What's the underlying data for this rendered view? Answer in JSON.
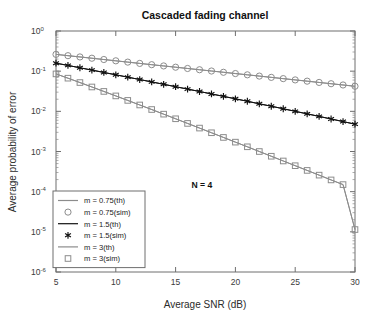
{
  "chart_data": {
    "type": "line",
    "title": "Cascaded fading channel",
    "xlabel": "Average SNR (dB)",
    "ylabel": "Average probability of error",
    "xlim": [
      5,
      30
    ],
    "ylim": [
      1e-06,
      1
    ],
    "yscale": "log",
    "grid": false,
    "legend_position": "lower-left",
    "xticks": [
      5,
      10,
      15,
      20,
      25,
      30
    ],
    "xtick_labels": [
      "5",
      "10",
      "15",
      "20",
      "25",
      "30"
    ],
    "yticks": [
      1,
      0.1,
      0.01,
      0.001,
      0.0001,
      1e-05,
      1e-06
    ],
    "ytick_labels": [
      "10^0",
      "10^-1",
      "10^-2",
      "10^-3",
      "10^-4",
      "10^-5",
      "10^-6"
    ],
    "ytick_mantissa": [
      "10",
      "10",
      "10",
      "10",
      "10",
      "10",
      "10"
    ],
    "ytick_exponent": [
      "0",
      "-1",
      "-2",
      "-3",
      "-4",
      "-5",
      "-6"
    ],
    "annotations": [
      {
        "text": "N = 4",
        "x": 17.2,
        "y": 0.00012
      }
    ],
    "x": [
      5,
      6,
      7,
      8,
      9,
      10,
      11,
      12,
      13,
      14,
      15,
      16,
      17,
      18,
      19,
      20,
      21,
      22,
      23,
      24,
      25,
      26,
      27,
      28,
      29,
      30
    ],
    "series": [
      {
        "name": "m = 0.75(th)",
        "label": "m = 0.75(th)",
        "marker": "none",
        "line": "solid",
        "color": "#8c8c8c",
        "values": [
          0.262,
          0.243,
          0.226,
          0.21,
          0.195,
          0.181,
          0.168,
          0.156,
          0.145,
          0.135,
          0.1255,
          0.1167,
          0.1085,
          0.1009,
          0.0938,
          0.0872,
          0.0811,
          0.0754,
          0.0701,
          0.0652,
          0.0606,
          0.0564,
          0.0524,
          0.0487,
          0.0453,
          0.0421
        ]
      },
      {
        "name": "m = 0.75(sim)",
        "label": "m = 0.75(sim)",
        "marker": "circle",
        "line": "solid",
        "color": "#8c8c8c",
        "values": [
          0.262,
          0.243,
          0.226,
          0.21,
          0.195,
          0.181,
          0.168,
          0.156,
          0.145,
          0.135,
          0.1255,
          0.1167,
          0.1085,
          0.1009,
          0.0938,
          0.0872,
          0.0811,
          0.0754,
          0.0701,
          0.0652,
          0.0606,
          0.0564,
          0.0524,
          0.0487,
          0.0453,
          0.0421
        ]
      },
      {
        "name": "m = 1.5(th)",
        "label": "m = 1.5(th)",
        "marker": "none",
        "line": "solid",
        "color": "#111111",
        "values": [
          0.158,
          0.139,
          0.1215,
          0.1063,
          0.0929,
          0.0812,
          0.0709,
          0.0619,
          0.054,
          0.0471,
          0.0411,
          0.0358,
          0.0312,
          0.0271,
          0.0236,
          0.0205,
          0.0178,
          0.0154,
          0.0134,
          0.0116,
          0.01,
          0.00866,
          0.00748,
          0.00645,
          0.00556,
          0.00479
        ]
      },
      {
        "name": "m = 1.5(sim)",
        "label": "m = 1.5(sim)",
        "marker": "star",
        "line": "solid",
        "color": "#111111",
        "values": [
          0.158,
          0.139,
          0.1215,
          0.1063,
          0.0929,
          0.0812,
          0.0709,
          0.0619,
          0.054,
          0.0471,
          0.0411,
          0.0358,
          0.0312,
          0.0271,
          0.0236,
          0.0205,
          0.0178,
          0.0154,
          0.0134,
          0.0116,
          0.01,
          0.00866,
          0.00748,
          0.00645,
          0.00556,
          0.00479
        ]
      },
      {
        "name": "m = 3(th)",
        "label": "m = 3(th)",
        "marker": "none",
        "line": "solid",
        "color": "#8c8c8c",
        "values": [
          0.0855,
          0.0669,
          0.0521,
          0.0404,
          0.0313,
          0.0242,
          0.0187,
          0.0144,
          0.0111,
          0.00851,
          0.00653,
          0.005,
          0.00383,
          0.00293,
          0.00224,
          0.00171,
          0.00131,
          0.000999,
          0.000762,
          0.000581,
          0.000443,
          0.000338,
          0.000258,
          0.000196,
          0.00015,
          1.14e-05
        ]
      },
      {
        "name": "m = 3(sim)",
        "label": "m = 3(sim)",
        "marker": "square",
        "line": "solid",
        "color": "#8c8c8c",
        "values": [
          0.0855,
          0.0669,
          0.0521,
          0.0404,
          0.0313,
          0.0242,
          0.0187,
          0.0144,
          0.0111,
          0.00851,
          0.00653,
          0.005,
          0.00383,
          0.00293,
          0.00224,
          0.00171,
          0.00131,
          0.000999,
          0.000762,
          0.000581,
          0.000443,
          0.000338,
          0.000258,
          0.000196,
          0.00015,
          1.14e-05
        ]
      }
    ],
    "legend_entries": [
      {
        "label": "m = 0.75(th)",
        "marker": "none",
        "color": "#8c8c8c"
      },
      {
        "label": "m = 0.75(sim)",
        "marker": "circle",
        "color": "#8c8c8c"
      },
      {
        "label": "m = 1.5(th)",
        "marker": "none",
        "color": "#111111"
      },
      {
        "label": "m = 1.5(sim)",
        "marker": "star",
        "color": "#111111"
      },
      {
        "label": "m = 3(th)",
        "marker": "none",
        "color": "#8c8c8c"
      },
      {
        "label": "m = 3(sim)",
        "marker": "square",
        "color": "#8c8c8c"
      }
    ]
  }
}
